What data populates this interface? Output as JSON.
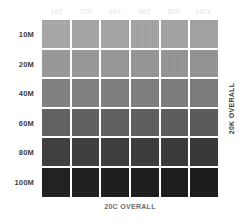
{
  "chart_data": {
    "type": "heatmap",
    "title": "",
    "xlabel": "20C OVERALL",
    "ylabel": "20K OVERALL",
    "grid": false,
    "legend": "none",
    "categories_x": [
      "10Y",
      "20Y",
      "40Y",
      "60Y",
      "80Y",
      "100Y"
    ],
    "categories_y": [
      "10M",
      "20M",
      "40M",
      "60M",
      "80M",
      "100M"
    ],
    "value_unit": "gray level (hex swatch)",
    "series": [
      {
        "name": "10M",
        "values": [
          "#a8a8a8",
          "#a6a6a6",
          "#a6a6a6",
          "#a5a5a5",
          "#a4a4a4",
          "#a3a3a3"
        ]
      },
      {
        "name": "20M",
        "values": [
          "#9a9a9a",
          "#999999",
          "#989898",
          "#979797",
          "#969696",
          "#949494"
        ]
      },
      {
        "name": "40M",
        "values": [
          "#818181",
          "#808080",
          "#7f7f7f",
          "#7e7e7e",
          "#7c7c7c",
          "#7a7a7a"
        ]
      },
      {
        "name": "60M",
        "values": [
          "#5f5f5f",
          "#5e5e5e",
          "#5d5d5d",
          "#5c5c5c",
          "#5a5a5a",
          "#585858"
        ]
      },
      {
        "name": "80M",
        "values": [
          "#3b3b3b",
          "#3a3a3a",
          "#393939",
          "#383838",
          "#363636",
          "#343434"
        ]
      },
      {
        "name": "100M",
        "values": [
          "#1b1b1b",
          "#1a1a1a",
          "#191919",
          "#181818",
          "#171717",
          "#161616"
        ]
      }
    ]
  },
  "colors": {
    "background": "#ffffff",
    "row_label": "#3d3d3d",
    "col_header": "#ececec",
    "bottom_caption": "#6e6e6e",
    "right_caption": "#3d3d3d"
  }
}
